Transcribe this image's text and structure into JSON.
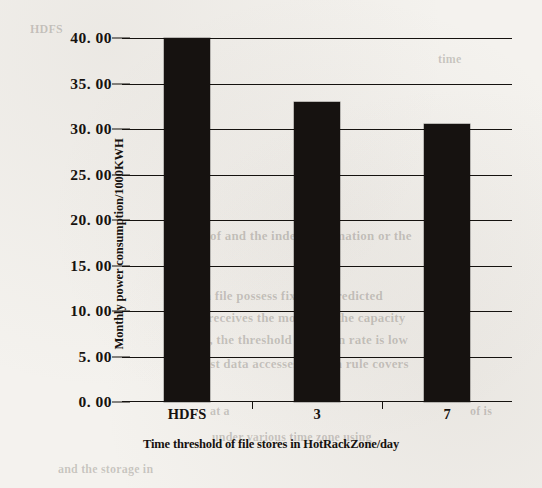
{
  "chart_data": {
    "type": "bar",
    "title": "",
    "categories": [
      "HDFS",
      "3",
      "7"
    ],
    "values": [
      40.0,
      33.0,
      30.5
    ],
    "series": [
      {
        "name": "Monthly power consumption",
        "values": [
          40.0,
          33.0,
          30.5
        ]
      }
    ],
    "xlabel": "Time threshold of file stores in HotRackZone/day",
    "ylabel": "Monthly power consumption/1000KWH",
    "ylim": [
      0,
      40
    ],
    "ytick_step": 5,
    "ytick_labels": [
      "40. 00",
      "35. 00",
      "30. 00",
      "25. 00",
      "20. 00",
      "15. 00",
      "10. 00",
      "5. 00",
      "0. 00"
    ],
    "ytick_values": [
      40,
      35,
      30,
      25,
      20,
      15,
      10,
      5,
      0
    ],
    "grid": true,
    "legend": "none",
    "bar_color": "#161210"
  },
  "bleed_through": [
    {
      "text": "of and the index information or the",
      "x": 210,
      "y": 228,
      "size": 13,
      "rotate": 0
    },
    {
      "text": "in file possess fixed or predicted",
      "x": 200,
      "y": 288,
      "size": 13,
      "rotate": 0
    },
    {
      "text": "it receives the motion of the capacity",
      "x": 196,
      "y": 310,
      "size": 13,
      "rotate": 0
    },
    {
      "text": "low, the threshold duration rate is low",
      "x": 190,
      "y": 332,
      "size": 13,
      "rotate": 0
    },
    {
      "text": "host data accesses motion rule covers",
      "x": 196,
      "y": 356,
      "size": 13,
      "rotate": 0
    },
    {
      "text": "at a",
      "x": 210,
      "y": 404,
      "size": 12,
      "rotate": 0
    },
    {
      "text": "under various time zone using",
      "x": 212,
      "y": 430,
      "size": 12,
      "rotate": 0
    },
    {
      "text": "and the storage in",
      "x": 58,
      "y": 462,
      "size": 12,
      "rotate": 0
    },
    {
      "text": "of is",
      "x": 470,
      "y": 404,
      "size": 12,
      "rotate": 0
    },
    {
      "text": "6)",
      "x": 448,
      "y": 346,
      "size": 13,
      "rotate": 0
    },
    {
      "text": "l.",
      "x": 432,
      "y": 322,
      "size": 13,
      "rotate": 0
    },
    {
      "text": "HDFS",
      "x": 30,
      "y": 22,
      "size": 12,
      "rotate": 0
    },
    {
      "text": "time",
      "x": 438,
      "y": 52,
      "size": 12,
      "rotate": 0
    }
  ]
}
